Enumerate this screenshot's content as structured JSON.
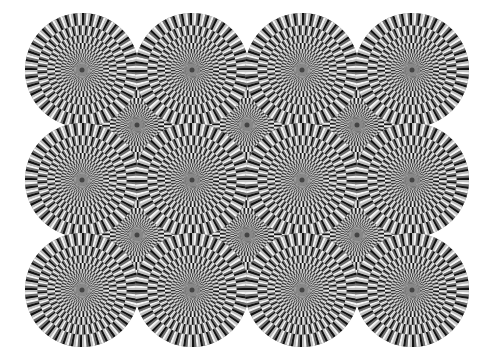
{
  "image": {
    "description": "Rotating Snakes optical illusion: grid of circular disks made of concentric rings of black, dark gray, white and light gray segments",
    "background": "#ffffff",
    "palette": {
      "black": "#111111",
      "dark_gray": "#6e6e6e",
      "white": "#f5f5f5",
      "light_gray": "#bdbdbd"
    },
    "disk_radius": 57,
    "layers": [
      {
        "name": "back",
        "centers": [
          [
            137,
            125
          ],
          [
            247,
            125
          ],
          [
            357,
            125
          ],
          [
            137,
            235
          ],
          [
            247,
            235
          ],
          [
            357,
            235
          ]
        ]
      },
      {
        "name": "front",
        "centers": [
          [
            82,
            70
          ],
          [
            192,
            70
          ],
          [
            302,
            70
          ],
          [
            412,
            70
          ],
          [
            82,
            180
          ],
          [
            192,
            180
          ],
          [
            302,
            180
          ],
          [
            412,
            180
          ],
          [
            82,
            290
          ],
          [
            192,
            290
          ],
          [
            302,
            290
          ],
          [
            412,
            290
          ]
        ]
      }
    ],
    "rings": 9,
    "segments_outer": 40
  },
  "caption": "Rotating snakes illusion"
}
